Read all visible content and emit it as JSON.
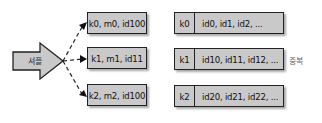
{
  "diagram": {
    "shuffle": {
      "label": "셔플",
      "icon": "block-arrow-right"
    },
    "records": [
      {
        "label": "k0, m0, id100"
      },
      {
        "label": "k1, m1, id11"
      },
      {
        "label": "k2, m2, id100"
      }
    ],
    "groups": [
      {
        "key": "k0",
        "values": "id0, id1, id2, ..."
      },
      {
        "key": "k1",
        "values": "id10, id11, id12, ..."
      },
      {
        "key": "k2",
        "values": "id20, id21, id22, ..."
      }
    ],
    "annotation": "중복",
    "colors": {
      "box_fill": "#c9c9c9",
      "border": "#222222",
      "arrow_fill": "#c9c9c9"
    }
  }
}
